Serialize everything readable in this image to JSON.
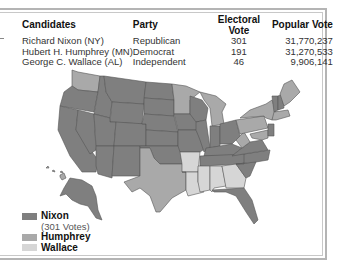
{
  "table": {
    "headers": [
      "Candidates",
      "Party",
      "Electoral Vote",
      "Popular Vote"
    ],
    "rows": [
      {
        "candidate": "Richard Nixon (NY)",
        "party": "Republican",
        "electoral": "301",
        "popular": "31,770,237"
      },
      {
        "candidate": "Hubert H. Humphrey (MN)",
        "party": "Democrat",
        "electoral": "191",
        "popular": "31,270,533"
      },
      {
        "candidate": "George C. Wallace (AL)",
        "party": "Independent",
        "electoral": "46",
        "popular": "9,906,141"
      }
    ]
  },
  "legend": {
    "nixon": {
      "label": "Nixon",
      "sub": "(301 Votes)",
      "color": "#7f7f7f"
    },
    "humphrey": {
      "label": "Humphrey",
      "color": "#a9a9a9"
    },
    "wallace": {
      "label": "Wallace",
      "color": "#d6d6d6"
    }
  },
  "colors": {
    "nixon": "#7f7f7f",
    "humphrey": "#a9a9a9",
    "wallace": "#d6d6d6",
    "border": "#555555",
    "frame": "#b4b4b4"
  }
}
